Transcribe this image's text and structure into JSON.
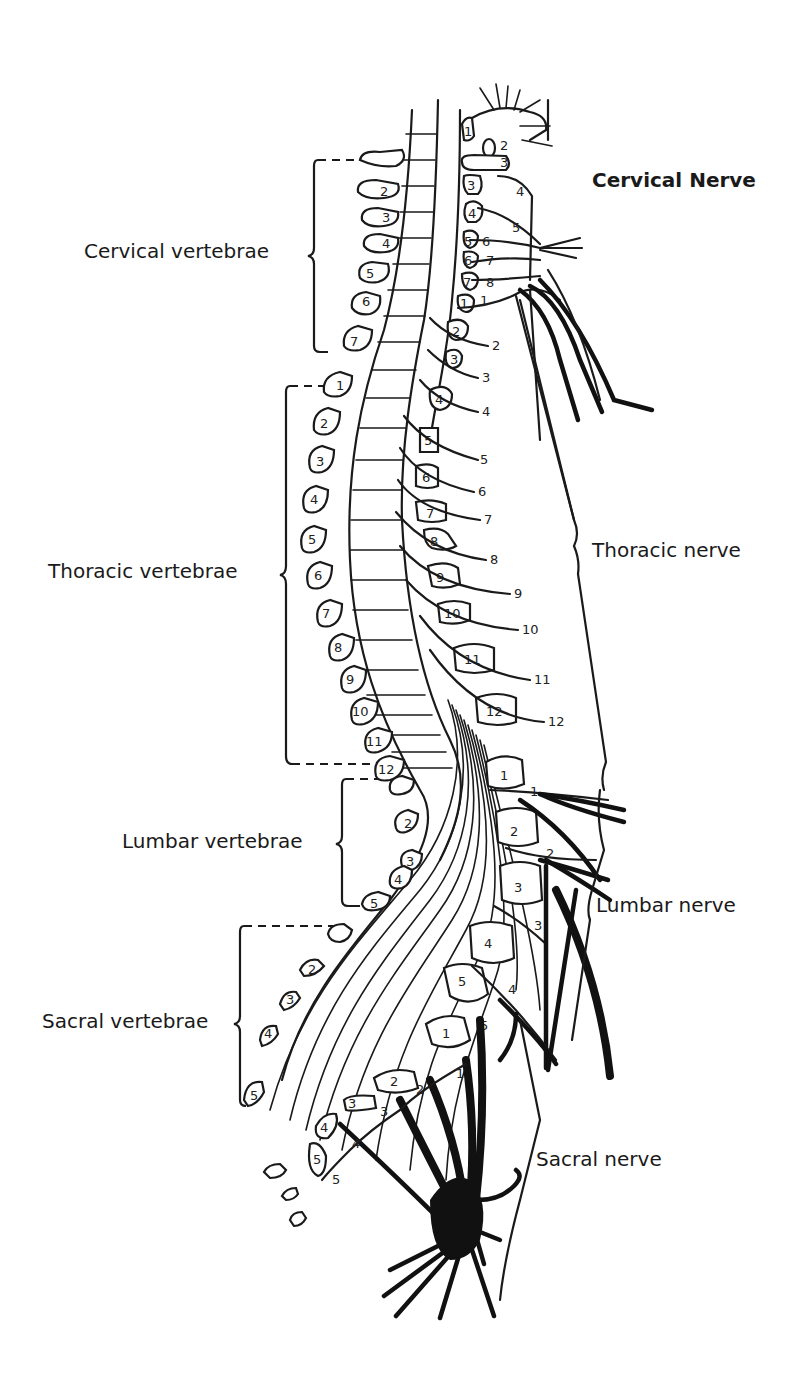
{
  "labels": {
    "cervical_vertebrae": "Cervical vertebrae",
    "thoracic_vertebrae": "Thoracic vertebrae",
    "lumbar_vertebrae": "Lumbar vertebrae",
    "sacral_vertebrae": "Sacral vertebrae",
    "cervical_nerve": "Cervical Nerve",
    "thoracic_nerve": "Thoracic nerve",
    "lumbar_nerve": "Lumbar nerve",
    "sacral_nerve": "Sacral nerve"
  },
  "vertebrae": {
    "cervical": [
      "1",
      "2",
      "3",
      "4",
      "5",
      "6",
      "7"
    ],
    "thoracic": [
      "1",
      "2",
      "3",
      "4",
      "5",
      "6",
      "7",
      "8",
      "9",
      "10",
      "11",
      "12"
    ],
    "lumbar": [
      "1",
      "2",
      "3",
      "4",
      "5"
    ],
    "sacral": [
      "1",
      "2",
      "3",
      "4",
      "5"
    ]
  },
  "nerves": {
    "cervical": [
      "1",
      "2",
      "3",
      "4",
      "5",
      "6",
      "7",
      "8"
    ],
    "thoracic": [
      "1",
      "2",
      "3",
      "4",
      "5",
      "6",
      "7",
      "8",
      "9",
      "10",
      "11",
      "12"
    ],
    "lumbar": [
      "1",
      "2",
      "3",
      "4",
      "5"
    ],
    "sacral": [
      "1",
      "2",
      "3",
      "4",
      "5"
    ]
  },
  "left_column": {
    "cervical": [
      "2",
      "3",
      "4",
      "5",
      "6",
      "7"
    ],
    "thoracic": [
      "1",
      "2",
      "3",
      "4",
      "5",
      "6",
      "7",
      "8",
      "9",
      "10",
      "11",
      "12"
    ],
    "lumbar": [
      "2",
      "3",
      "4",
      "5"
    ],
    "sacral": [
      "2",
      "3",
      "4",
      "5"
    ]
  },
  "right_column": {
    "cervical_bodies": [
      "1",
      "2",
      "3",
      "3",
      "4",
      "5",
      "6",
      "7"
    ],
    "cervical_nerves": [
      "4",
      "5",
      "6",
      "7",
      "8",
      "1"
    ],
    "thoracic_bodies": [
      "1",
      "2",
      "3",
      "4",
      "5",
      "6",
      "7",
      "8",
      "9",
      "10",
      "11",
      "12"
    ],
    "thoracic_nerves": [
      "2",
      "3",
      "4",
      "5",
      "6",
      "7",
      "8",
      "9",
      "10",
      "11",
      "12"
    ],
    "lumbar_bodies": [
      "1",
      "2",
      "3",
      "4",
      "5"
    ],
    "lumbar_nerves": [
      "1",
      "2",
      "3",
      "4",
      "5"
    ],
    "sacral_bodies": [
      "1",
      "2",
      "3",
      "4",
      "5"
    ],
    "sacral_nerves": [
      "1",
      "2",
      "3",
      "4",
      "5"
    ]
  }
}
